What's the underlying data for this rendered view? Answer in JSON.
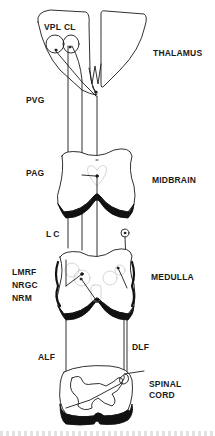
{
  "diagram": {
    "regions": [
      {
        "id": "thalamus",
        "label": "THALAMUS"
      },
      {
        "id": "midbrain",
        "label": "MIDBRAIN"
      },
      {
        "id": "medulla",
        "label": "MEDULLA"
      },
      {
        "id": "spinal_cord",
        "label": "SPINAL CORD",
        "lines": [
          "SPINAL",
          "CORD"
        ]
      }
    ],
    "nuclei": [
      {
        "id": "vpl",
        "label": "VPL"
      },
      {
        "id": "cl",
        "label": "CL"
      },
      {
        "id": "pvg",
        "label": "PVG"
      },
      {
        "id": "pag",
        "label": "PAG"
      },
      {
        "id": "lc",
        "label": "LC"
      },
      {
        "id": "lmrf",
        "label": "LMRF"
      },
      {
        "id": "nrgc",
        "label": "NRGC"
      },
      {
        "id": "nrm",
        "label": "NRM"
      }
    ],
    "tracts": [
      {
        "id": "alf",
        "label": "ALF"
      },
      {
        "id": "dlf",
        "label": "DLF"
      }
    ],
    "colors": {
      "line": "#1a1a1a",
      "fill": "#ffffff",
      "shadow": "#111111"
    }
  }
}
